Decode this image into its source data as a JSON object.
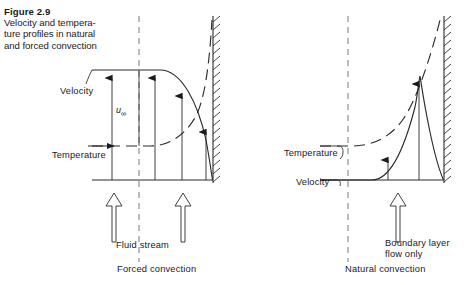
{
  "figure": {
    "number": "Figure 2.9",
    "caption_lines": [
      "Velocity and tempera-",
      "ture profiles in natural",
      "and forced convection"
    ]
  },
  "panels": [
    {
      "id": "forced",
      "title": "Forced convection",
      "labels": {
        "velocity": "Velocity",
        "temperature": "Temperature",
        "freestream": "u",
        "freestream_sub": "∞",
        "stream": "Fluid stream"
      },
      "velocity_profile": {
        "description": "uniform free-stream velocity decaying to zero at the wall",
        "arrow_heights": [
          82,
          82,
          82,
          62
        ],
        "arrow_x": [
          112,
          155,
          182,
          206
        ],
        "baseline_y": 180,
        "wall_x": 213
      },
      "temperature_profile": {
        "description": "dashed curve rising from free-stream toward the wall",
        "style": "dashed"
      }
    },
    {
      "id": "natural",
      "title": "Natural convection",
      "labels": {
        "velocity": "Velocity",
        "temperature": "Temperature",
        "boundary_layer_line1": "Boundary layer",
        "boundary_layer_line2": "flow only"
      },
      "velocity_profile": {
        "description": "zero in free stream, peaks inside boundary layer, returns to zero at wall",
        "arrow_heights": [
          28,
          105
        ],
        "arrow_x": [
          388,
          419
        ],
        "baseline_y": 180,
        "wall_x": 444
      },
      "temperature_profile": {
        "description": "dashed curve rising from free-stream toward the wall",
        "style": "dashed"
      }
    }
  ],
  "colors": {
    "ink": "#1a1a1a",
    "line": "#2b2b2b",
    "background": "#ffffff"
  }
}
